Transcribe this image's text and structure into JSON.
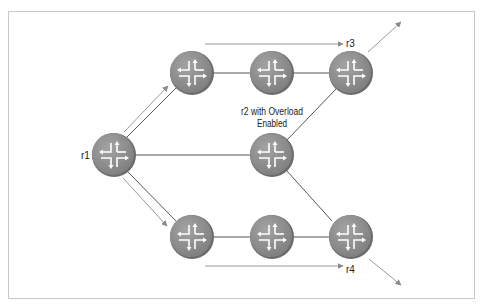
{
  "diagram": {
    "title": "",
    "colors": {
      "router_fill": "#8f8f8f",
      "router_edge": "#6e6e6e",
      "icon_stroke": "#ffffff",
      "link": "#555555",
      "flow_arrow": "#999999",
      "frame": "#c8c8c8"
    },
    "nodes": [
      {
        "id": "r1",
        "label": "r1",
        "x": 114,
        "y": 155
      },
      {
        "id": "top1",
        "label": "",
        "x": 192,
        "y": 73
      },
      {
        "id": "top2",
        "label": "",
        "x": 272,
        "y": 73
      },
      {
        "id": "r3",
        "label": "r3",
        "x": 351,
        "y": 73
      },
      {
        "id": "r2",
        "label": "r2 with Overload Enabled",
        "x": 272,
        "y": 155
      },
      {
        "id": "bot1",
        "label": "",
        "x": 192,
        "y": 237
      },
      {
        "id": "bot2",
        "label": "",
        "x": 272,
        "y": 237
      },
      {
        "id": "r4",
        "label": "r4",
        "x": 351,
        "y": 237
      }
    ],
    "labels": {
      "r1": "r1",
      "r3": "r3",
      "r4": "r4",
      "r2_line1": "r2 with Overload",
      "r2_line2": "Enabled"
    },
    "links": [
      [
        "r1",
        "top1"
      ],
      [
        "top1",
        "top2"
      ],
      [
        "top2",
        "r3"
      ],
      [
        "r1",
        "r2"
      ],
      [
        "r2",
        "r3"
      ],
      [
        "r2",
        "r4"
      ],
      [
        "r1",
        "bot1"
      ],
      [
        "bot1",
        "bot2"
      ],
      [
        "bot2",
        "r4"
      ]
    ],
    "flow_arrows": [
      {
        "desc": "r1 to top1 traffic"
      },
      {
        "desc": "top path toward r3"
      },
      {
        "desc": "r3 exit"
      },
      {
        "desc": "r1 to bot1 traffic"
      },
      {
        "desc": "bottom path toward r4"
      },
      {
        "desc": "r4 exit"
      }
    ]
  }
}
